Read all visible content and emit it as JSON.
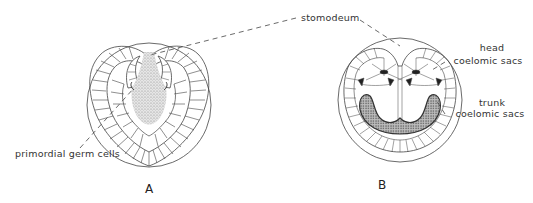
{
  "figure": {
    "panels": [
      {
        "id": "A",
        "label": "A"
      },
      {
        "id": "B",
        "label": "B"
      }
    ],
    "labels": {
      "stomodeum": "stomodeum",
      "head_coelomic_sacs_line1": "head",
      "head_coelomic_sacs_line2": "coelomic sacs",
      "trunk_coelomic_sacs_line1": "trunk",
      "trunk_coelomic_sacs_line2": "coelomic sacs",
      "primordial_germ_cells": "primordial germ cells"
    },
    "colors": {
      "line": "#444444",
      "stipple": "#9a9a9a",
      "stipple_dark": "#555555"
    }
  }
}
